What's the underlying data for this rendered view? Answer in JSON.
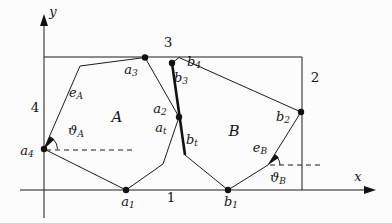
{
  "figure": {
    "axes": {
      "x_label": "x",
      "y_label": "y"
    },
    "container_edge_numbers": {
      "bottom": "1",
      "right": "2",
      "top": "3",
      "left": "4"
    },
    "regions": {
      "polygon_a": "A",
      "polygon_b": "B"
    },
    "labels": {
      "a1": {
        "base": "a",
        "sub": "1"
      },
      "a2": {
        "base": "a",
        "sub": "2"
      },
      "a3": {
        "base": "a",
        "sub": "3"
      },
      "a4": {
        "base": "a",
        "sub": "4"
      },
      "at": {
        "base": "a",
        "sub": "t"
      },
      "b1": {
        "base": "b",
        "sub": "1"
      },
      "b2": {
        "base": "b",
        "sub": "2"
      },
      "b3": {
        "base": "b",
        "sub": "3"
      },
      "b4": {
        "base": "b",
        "sub": "4"
      },
      "bt": {
        "base": "b",
        "sub": "t"
      },
      "eA": {
        "base": "e",
        "sub": "A"
      },
      "eB": {
        "base": "e",
        "sub": "B"
      },
      "thetaA": {
        "base": "ϑ",
        "sub": "A"
      },
      "thetaB": {
        "base": "ϑ",
        "sub": "B"
      }
    },
    "colors": {
      "ink": "#1c1c1c",
      "background": "#fcfcfc"
    }
  }
}
